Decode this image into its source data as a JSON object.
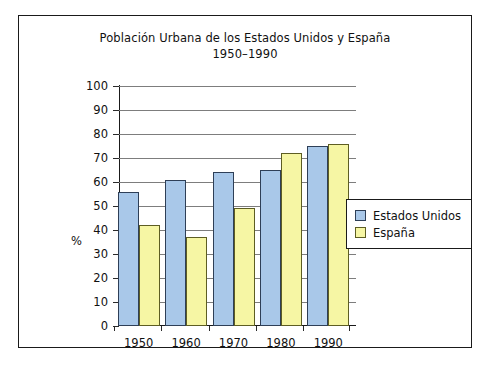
{
  "chart_data": {
    "type": "bar",
    "title": "Población Urbana de los Estados Unidos y España",
    "subtitle": "1950–1990",
    "xlabel": "",
    "ylabel": "%",
    "categories": [
      "1950",
      "1960",
      "1970",
      "1980",
      "1990"
    ],
    "series": [
      {
        "name": "Estados Unidos",
        "color": "#a9c8e9",
        "values": [
          56,
          61,
          64,
          65,
          75
        ]
      },
      {
        "name": "España",
        "color": "#f6f6a4",
        "values": [
          42,
          37,
          49,
          72,
          76
        ]
      }
    ],
    "ylim": [
      0,
      100
    ],
    "ytick_step": 10,
    "yticks": [
      "0",
      "10",
      "20",
      "30",
      "40",
      "50",
      "60",
      "70",
      "80",
      "90",
      "100"
    ],
    "grid": true,
    "legend_position": "right-inside"
  },
  "legend": {
    "entries": [
      {
        "label": "Estados Unidos"
      },
      {
        "label": "España"
      }
    ]
  }
}
